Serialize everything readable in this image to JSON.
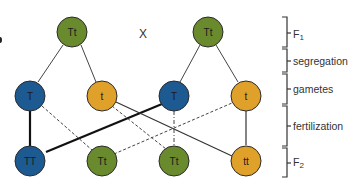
{
  "diagram": {
    "cross_symbol": "X",
    "colors": {
      "heterozygous": "#6a8a2e",
      "dominant": "#1d5a92",
      "recessive": "#e0a12a",
      "stroke": "#2b2b2b"
    },
    "nodes": {
      "f1_left": {
        "label": "Tt"
      },
      "f1_right": {
        "label": "Tt"
      },
      "gamete_1": {
        "label": "T"
      },
      "gamete_2": {
        "label": "t"
      },
      "gamete_3": {
        "label": "T"
      },
      "gamete_4": {
        "label": "t"
      },
      "f2_1": {
        "label": "TT"
      },
      "f2_2": {
        "label": "Tt"
      },
      "f2_3": {
        "label": "Tt"
      },
      "f2_4": {
        "label": "tt"
      }
    },
    "stages": {
      "f1": {
        "main": "F",
        "sub": "1"
      },
      "segregation": "segregation",
      "gametes": "gametes",
      "fertilization": "fertilization",
      "f2": {
        "main": "F",
        "sub": "2"
      }
    }
  }
}
